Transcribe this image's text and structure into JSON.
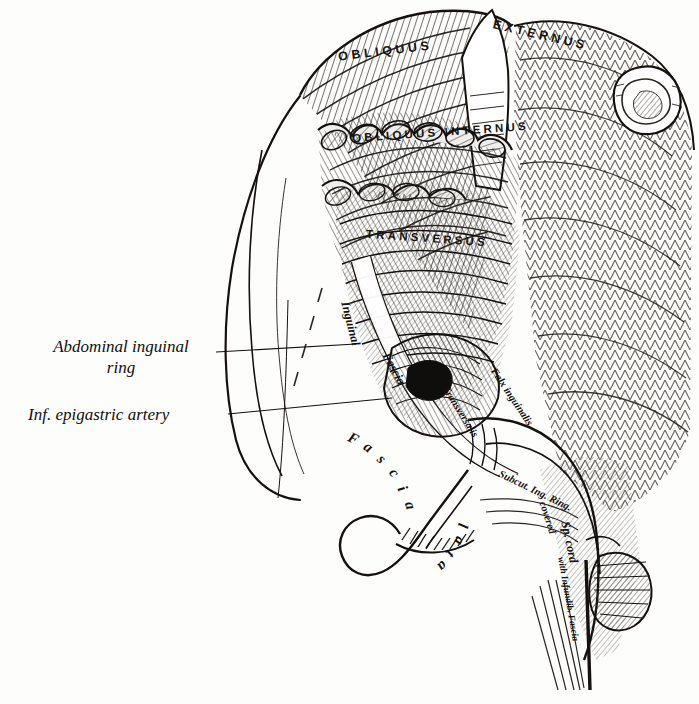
{
  "figure": {
    "style": "anatomical line engraving",
    "ink_color": "#14110f",
    "paper_color": "#fdfdfc"
  },
  "callouts": [
    {
      "id": "abdominal-inguinal-ring",
      "line1": "Abdominal inguinal",
      "line2": "ring"
    },
    {
      "id": "inf-epigastric-artery",
      "line1": "Inf. epigastric artery",
      "line2": ""
    }
  ],
  "muscle_labels": [
    {
      "id": "obliquus",
      "text": "OBLIQUUS"
    },
    {
      "id": "externus",
      "text": "EXTERNUS"
    },
    {
      "id": "obliquus-internus",
      "text": "OBLIQUUS  INTERNUS"
    },
    {
      "id": "transversus",
      "text": "TRANSVERSUS"
    }
  ],
  "structure_labels": [
    {
      "id": "inguinal",
      "text": "Inguinal"
    },
    {
      "id": "fascia-upper",
      "text": "Fascia"
    },
    {
      "id": "falx-inguinalis",
      "text": "Falx inguinalis"
    },
    {
      "id": "transversalis",
      "text": "Transversalis"
    },
    {
      "id": "subcut-ing-ring",
      "text": "Subcut. Ing. Ring."
    },
    {
      "id": "covered",
      "text": "covered"
    },
    {
      "id": "sp-cord",
      "text": "Sp. cord"
    },
    {
      "id": "with-infundib-fascia",
      "text": "with Infundib. Fascia"
    }
  ],
  "arc_labels": [
    {
      "id": "fascia-lata-fascia",
      "text": "Fascia"
    },
    {
      "id": "fascia-lata-lata",
      "text": "lata"
    }
  ]
}
